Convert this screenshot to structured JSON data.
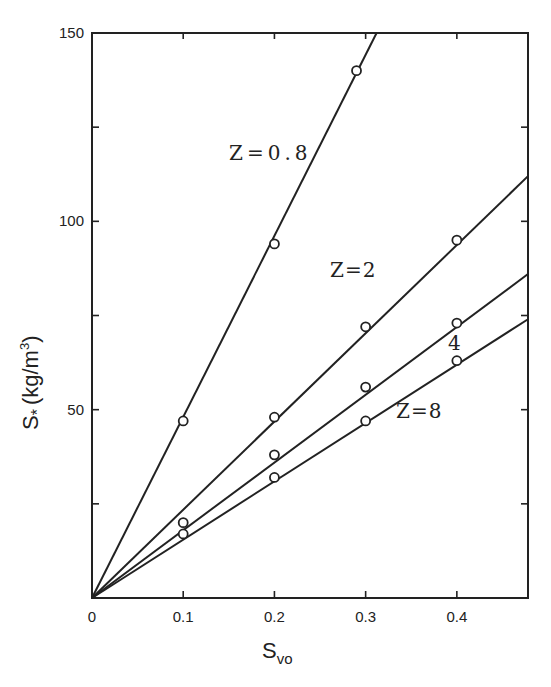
{
  "chart_data": {
    "type": "line",
    "title": "",
    "xlabel": "S_vo",
    "xlabel_main": "S",
    "xlabel_sub": "vo",
    "ylabel": "S* (kg/m^3)",
    "ylabel_main": "S",
    "ylabel_star": "*",
    "ylabel_unit": "(kg/m",
    "ylabel_exp": "3",
    "ylabel_close": ")",
    "xlim": [
      0,
      0.478
    ],
    "ylim": [
      0,
      150
    ],
    "x_ticks": [
      0.1,
      0.2,
      0.3,
      0.4
    ],
    "x_tick_labels": [
      "0",
      "0.1",
      "0.2",
      "0.3",
      "0.4"
    ],
    "y_ticks": [
      25,
      50,
      75,
      100,
      125,
      150
    ],
    "y_tick_labels": [
      "50",
      "100",
      "150"
    ],
    "grid": false,
    "legend": "inline labels",
    "series": [
      {
        "name": "Z=0.8",
        "label": "Z=0.8",
        "x": [
          0.1,
          0.2,
          0.29
        ],
        "values": [
          47,
          94,
          140
        ],
        "line_end": [
          0.312,
          150
        ]
      },
      {
        "name": "Z=2",
        "label": "Z=2",
        "x": [
          0.2,
          0.3,
          0.4
        ],
        "values": [
          48,
          72,
          95
        ],
        "line_end": [
          0.478,
          112
        ]
      },
      {
        "name": "Z=4",
        "label": "4",
        "x": [
          0.1,
          0.2,
          0.3,
          0.4
        ],
        "values": [
          20,
          38,
          56,
          73
        ],
        "line_end": [
          0.478,
          86
        ]
      },
      {
        "name": "Z=8",
        "label": "Z=8",
        "x": [
          0.1,
          0.2,
          0.3,
          0.4
        ],
        "values": [
          17,
          32,
          47,
          63
        ],
        "line_end": [
          0.478,
          74
        ]
      }
    ]
  }
}
